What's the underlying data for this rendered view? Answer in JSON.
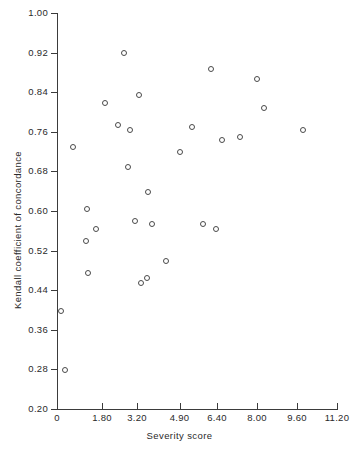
{
  "chart_data": {
    "type": "scatter",
    "title": "",
    "xlabel": "Severity score",
    "ylabel": "Kendall coefficient of concordance",
    "xlim": [
      0,
      11.2
    ],
    "ylim": [
      0.2,
      1.0
    ],
    "grid": false,
    "legend": null,
    "xticks": [
      0,
      1.8,
      3.2,
      4.9,
      6.4,
      8.0,
      9.6,
      11.2
    ],
    "xtick_labels": [
      "0",
      "1.80",
      "3.20",
      "4.90",
      "6.40",
      "8.00",
      "9.60",
      "11.20"
    ],
    "yticks": [
      0.2,
      0.28,
      0.36,
      0.44,
      0.52,
      0.6,
      0.68,
      0.76,
      0.84,
      0.92,
      1.0
    ],
    "ytick_labels": [
      "0.20",
      "0.28",
      "0.36",
      "0.44",
      "0.52",
      "0.60",
      "0.68",
      "0.76",
      "0.84",
      "0.92",
      "1.00"
    ],
    "marker": "open-circle",
    "marker_color": "#4a4a4a",
    "points": [
      {
        "x": 0.12,
        "y": 0.4
      },
      {
        "x": 0.28,
        "y": 0.28
      },
      {
        "x": 0.6,
        "y": 0.73
      },
      {
        "x": 1.12,
        "y": 0.54
      },
      {
        "x": 1.18,
        "y": 0.605
      },
      {
        "x": 1.2,
        "y": 0.475
      },
      {
        "x": 1.52,
        "y": 0.565
      },
      {
        "x": 1.9,
        "y": 0.82
      },
      {
        "x": 2.42,
        "y": 0.775
      },
      {
        "x": 2.64,
        "y": 0.92
      },
      {
        "x": 2.8,
        "y": 0.69
      },
      {
        "x": 2.9,
        "y": 0.765
      },
      {
        "x": 3.08,
        "y": 0.58
      },
      {
        "x": 3.26,
        "y": 0.835
      },
      {
        "x": 3.34,
        "y": 0.455
      },
      {
        "x": 3.58,
        "y": 0.465
      },
      {
        "x": 3.6,
        "y": 0.64
      },
      {
        "x": 3.76,
        "y": 0.575
      },
      {
        "x": 4.34,
        "y": 0.5
      },
      {
        "x": 4.9,
        "y": 0.72
      },
      {
        "x": 5.36,
        "y": 0.77
      },
      {
        "x": 5.82,
        "y": 0.575
      },
      {
        "x": 6.12,
        "y": 0.888
      },
      {
        "x": 6.32,
        "y": 0.565
      },
      {
        "x": 6.56,
        "y": 0.745
      },
      {
        "x": 7.3,
        "y": 0.75
      },
      {
        "x": 7.96,
        "y": 0.868
      },
      {
        "x": 8.26,
        "y": 0.81
      },
      {
        "x": 9.82,
        "y": 0.765
      }
    ]
  }
}
